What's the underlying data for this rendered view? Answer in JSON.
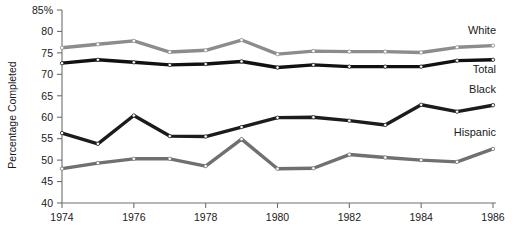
{
  "chart_data": {
    "type": "line",
    "title": "",
    "subtitle": "",
    "xlabel": "",
    "ylabel": "Percentage Completed",
    "x": [
      1974,
      1975,
      1976,
      1977,
      1978,
      1979,
      1980,
      1981,
      1982,
      1983,
      1984,
      1985,
      1986
    ],
    "xlim": [
      1974,
      1986
    ],
    "ylim": [
      40,
      85
    ],
    "xticks": [
      1974,
      1976,
      1978,
      1980,
      1982,
      1984,
      1986
    ],
    "xtick_labels": [
      "1974",
      "1976",
      "1978",
      "1980",
      "1982",
      "1984",
      "1986"
    ],
    "yticks": [
      40,
      45,
      50,
      55,
      60,
      65,
      70,
      75,
      80,
      85
    ],
    "ytick_labels": [
      "40",
      "45",
      "50",
      "55",
      "60",
      "65",
      "70",
      "75",
      "80",
      "85%"
    ],
    "grid": false,
    "legend_position": "right-inline",
    "markers": "open-circle",
    "series": [
      {
        "name": "White",
        "label": "White",
        "color": "#8c8c8c",
        "values": [
          76.2,
          77.0,
          77.8,
          75.2,
          75.6,
          78.0,
          74.7,
          75.4,
          75.3,
          75.3,
          75.1,
          76.3,
          76.7
        ]
      },
      {
        "name": "Total",
        "label": "Total",
        "color": "#111111",
        "values": [
          72.6,
          73.4,
          72.8,
          72.2,
          72.4,
          73.0,
          71.6,
          72.2,
          71.8,
          71.8,
          71.8,
          73.2,
          73.4
        ]
      },
      {
        "name": "Black",
        "label": "Black",
        "color": "#1c1c1c",
        "values": [
          56.3,
          53.8,
          60.4,
          55.6,
          55.5,
          57.7,
          59.9,
          60.0,
          59.2,
          58.2,
          62.9,
          61.3,
          62.8
        ]
      },
      {
        "name": "Hispanic",
        "label": "Hispanic",
        "color": "#707070",
        "values": [
          48.0,
          49.3,
          50.3,
          50.3,
          48.6,
          54.9,
          48.0,
          48.1,
          51.3,
          50.6,
          50.0,
          49.6,
          52.6
        ]
      }
    ]
  },
  "labels": {
    "white": "White",
    "total": "Total",
    "black": "Black",
    "hispanic": "Hispanic"
  }
}
